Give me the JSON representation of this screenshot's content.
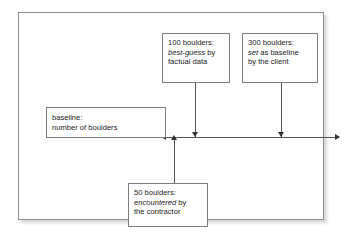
{
  "diagram": {
    "axis": {
      "name": "number-of-boulders-axis",
      "direction": "right",
      "line_color": "#555555"
    },
    "callouts": [
      {
        "id": "best-guess",
        "line1": "100 boulders:",
        "line2_emphasis": "best-guess",
        "line2_rest": " by",
        "line3": "factual data",
        "value": 100,
        "connector": "down-arrow-to-axis"
      },
      {
        "id": "client-baseline",
        "line1": "300 boulders:",
        "line2_emphasis": "set",
        "line2_rest": " as baseline",
        "line3": "by the client",
        "value": 300,
        "connector": "down-arrow-to-axis"
      },
      {
        "id": "baseline-label",
        "line1": "baseline:",
        "line2": "number of boulders",
        "connector": "axis-left-arrow"
      },
      {
        "id": "encountered",
        "line1": "50 boulders:",
        "line2_emphasis": "encountered",
        "line2_rest": " by",
        "line3": "the contractor",
        "value": 50,
        "connector": "up-arrow-to-axis"
      }
    ],
    "colors": {
      "frame_border": "#8c8c8c",
      "box_border": "#7d7d7d",
      "text": "#1a1a1a",
      "background": "#ffffff"
    }
  }
}
